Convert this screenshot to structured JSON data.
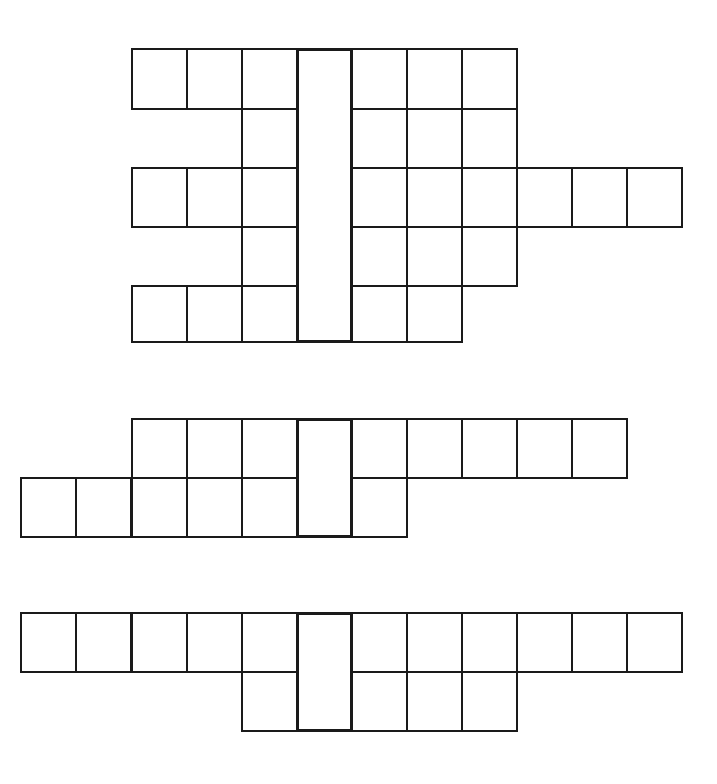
{
  "puzzle": {
    "type": "blank crossword-style grids with a vertical key column",
    "cell_size": 55,
    "line_color": "#1a1a1a",
    "background": "#ffffff",
    "grids": [
      {
        "id": "grid-1",
        "key_column": {
          "x": 296,
          "y": 48,
          "w": 55,
          "h": 293
        },
        "rows": [
          {
            "y": 48,
            "h": 60,
            "cells_x": [
              131,
              186,
              241,
              351,
              406,
              461
            ]
          },
          {
            "y": 108,
            "h": 59,
            "cells_x": [
              241,
              351,
              406,
              461
            ]
          },
          {
            "y": 167,
            "h": 59,
            "cells_x": [
              131,
              186,
              241,
              351,
              406,
              461,
              516,
              571,
              626
            ]
          },
          {
            "y": 226,
            "h": 59,
            "cells_x": [
              241,
              351,
              406,
              461
            ]
          },
          {
            "y": 285,
            "h": 56,
            "cells_x": [
              131,
              186,
              241,
              351,
              406
            ]
          }
        ]
      },
      {
        "id": "grid-2",
        "key_column": {
          "x": 296,
          "y": 418,
          "w": 55,
          "h": 118
        },
        "rows": [
          {
            "y": 418,
            "h": 59,
            "cells_x": [
              131,
              186,
              241,
              351,
              406,
              461,
              516,
              571
            ]
          },
          {
            "y": 477,
            "h": 59,
            "cells_x": [
              20,
              75,
              131,
              186,
              241,
              351
            ]
          }
        ]
      },
      {
        "id": "grid-3",
        "key_column": {
          "x": 296,
          "y": 612,
          "w": 55,
          "h": 118
        },
        "rows": [
          {
            "y": 612,
            "h": 59,
            "cells_x": [
              20,
              75,
              131,
              186,
              241,
              351,
              406,
              461,
              516,
              571,
              626
            ]
          },
          {
            "y": 671,
            "h": 59,
            "cells_x": [
              241,
              351,
              406,
              461
            ]
          }
        ]
      }
    ]
  }
}
